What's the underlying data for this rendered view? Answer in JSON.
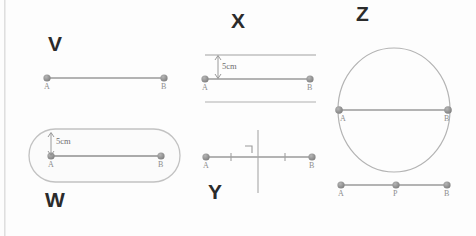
{
  "figure": {
    "title_visible": false,
    "background_color": "#fdfdfd",
    "stroke_color": "#9a9a9a",
    "point_color": "#8a8a8a",
    "label_color": "#2b2b2b"
  },
  "panels": [
    {
      "id": "V",
      "label": "V",
      "description": "plain line segment AB",
      "points": [
        {
          "name": "A",
          "label": "A"
        },
        {
          "name": "B",
          "label": "B"
        }
      ],
      "annotations": []
    },
    {
      "id": "X",
      "label": "X",
      "description": "segment AB with two parallel lines above and below, spacing marked 5cm",
      "points": [
        {
          "name": "A",
          "label": "A"
        },
        {
          "name": "B",
          "label": "B"
        }
      ],
      "annotations": [
        {
          "name": "distance-measure",
          "label": "5cm"
        }
      ]
    },
    {
      "id": "Z",
      "label": "Z",
      "description": "circle with segment AB drawn as a diameter",
      "points": [
        {
          "name": "A",
          "label": "A"
        },
        {
          "name": "B",
          "label": "B"
        }
      ],
      "annotations": []
    },
    {
      "id": "W",
      "label": "W",
      "description": "stadium / capsule region around segment AB, offset marked 5cm",
      "points": [
        {
          "name": "A",
          "label": "A"
        },
        {
          "name": "B",
          "label": "B"
        }
      ],
      "annotations": [
        {
          "name": "distance-measure",
          "label": "5cm"
        }
      ]
    },
    {
      "id": "Y",
      "label": "Y",
      "description": "segment AB with perpendicular bisector, congruence ticks and right angle mark",
      "points": [
        {
          "name": "A",
          "label": "A"
        },
        {
          "name": "B",
          "label": "B"
        }
      ],
      "annotations": [
        {
          "name": "right-angle-mark",
          "label": ""
        },
        {
          "name": "tick-mark-left",
          "label": ""
        },
        {
          "name": "tick-mark-right",
          "label": ""
        }
      ]
    },
    {
      "id": "unlabeled-bottom-right",
      "label": "",
      "description": "segment AB with interior point P",
      "points": [
        {
          "name": "A",
          "label": "A"
        },
        {
          "name": "P",
          "label": "P"
        },
        {
          "name": "B",
          "label": "B"
        }
      ],
      "annotations": []
    }
  ],
  "labels": {
    "V": "V",
    "W": "W",
    "X": "X",
    "Y": "Y",
    "Z": "Z",
    "A": "A",
    "B": "B",
    "P": "P",
    "five_cm": "5cm"
  }
}
